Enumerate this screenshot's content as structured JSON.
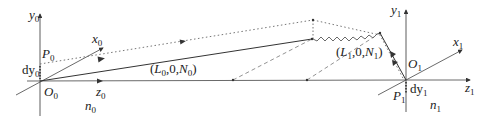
{
  "diagram": {
    "colors": {
      "stroke": "#333333",
      "dashed": "#777777",
      "dotted": "#666666",
      "background": "#ffffff"
    },
    "frame0": {
      "axis_y": {
        "label": "y",
        "sub": "0"
      },
      "axis_x": {
        "label": "x",
        "sub": "0"
      },
      "axis_z": {
        "label": "z",
        "sub": "0"
      },
      "origin": {
        "label": "O",
        "sub": "0"
      },
      "point": {
        "label": "P",
        "sub": "0"
      },
      "offset": {
        "label": "dy",
        "sub": "0"
      },
      "medium": {
        "label": "n",
        "sub": "0"
      }
    },
    "frame1": {
      "axis_y": {
        "label": "y",
        "sub": "1"
      },
      "axis_x": {
        "label": "x",
        "sub": "1"
      },
      "axis_z": {
        "label": "z",
        "sub": "1"
      },
      "origin": {
        "label": "O",
        "sub": "1"
      },
      "point": {
        "label": "P",
        "sub": "1"
      },
      "offset": {
        "label": "dy",
        "sub": "1"
      },
      "medium": {
        "label": "n",
        "sub": "1"
      }
    },
    "direction0": {
      "open": "(",
      "L": "L",
      "Lsub": "0",
      "mid": ",0,",
      "N": "N",
      "Nsub": "0",
      "close": ")"
    },
    "direction1": {
      "open": "(",
      "L": "L",
      "Lsub": "1",
      "mid": ",0,",
      "N": "N",
      "Nsub": "1",
      "close": ")"
    }
  }
}
